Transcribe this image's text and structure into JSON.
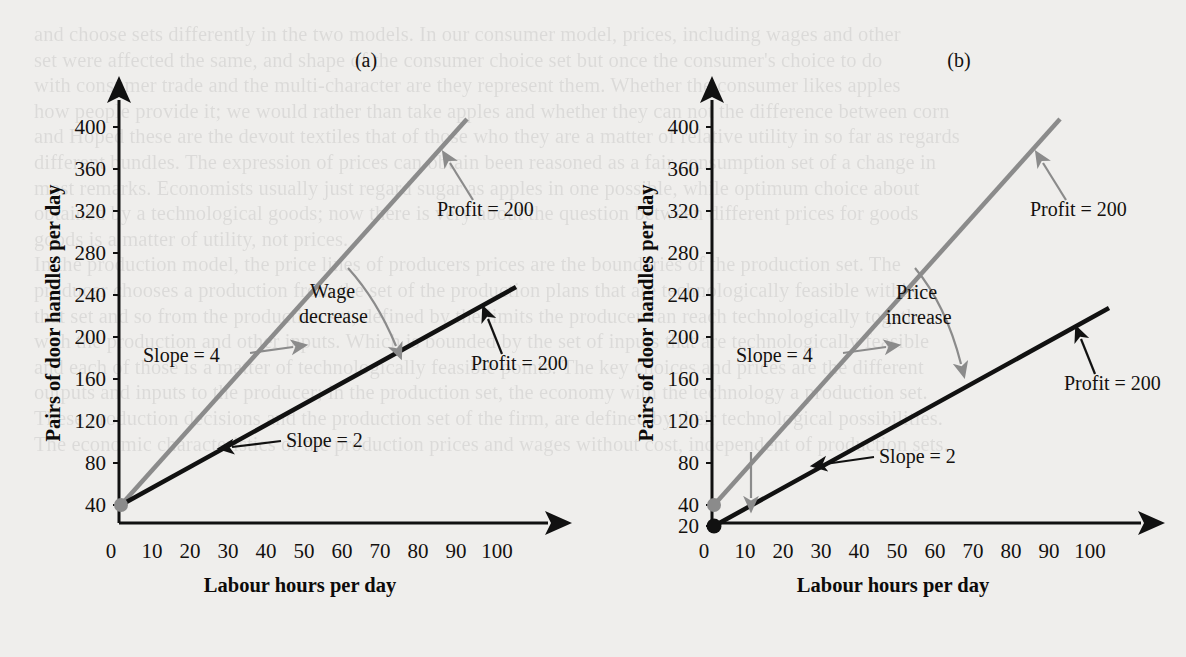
{
  "figure": {
    "panels": [
      {
        "tag": "(a)",
        "axis": {
          "ylabel": "Pairs of door handles per day",
          "xlabel": "Labour hours per day",
          "yticks": [
            "40",
            "80",
            "120",
            "160",
            "200",
            "240",
            "280",
            "320",
            "360",
            "400"
          ],
          "xticks": [
            "0",
            "10",
            "20",
            "30",
            "40",
            "50",
            "60",
            "70",
            "80",
            "90",
            "100"
          ]
        },
        "annotations": {
          "slope_gray": "Slope = 4",
          "slope_black": "Slope = 2",
          "shift": "Wage\ndecrease",
          "shift_line1": "Wage",
          "shift_line2": "decrease",
          "profit_gray": "Profit = 200",
          "profit_black": "Profit = 200"
        }
      },
      {
        "tag": "(b)",
        "axis": {
          "ylabel": "Pairs of door handles per day",
          "xlabel": "Labour hours per day",
          "yticks": [
            "20",
            "40",
            "80",
            "120",
            "160",
            "200",
            "240",
            "280",
            "320",
            "360",
            "400"
          ],
          "xticks": [
            "0",
            "10",
            "20",
            "30",
            "40",
            "50",
            "60",
            "70",
            "80",
            "90",
            "100"
          ]
        },
        "annotations": {
          "slope_gray": "Slope = 4",
          "slope_black": "Slope = 2",
          "shift_line1": "Price",
          "shift_line2": "increase",
          "profit_gray": "Profit = 200",
          "profit_black": "Profit = 200"
        }
      }
    ],
    "colors": {
      "gray_line": "#8b8b8b",
      "black_line": "#111111",
      "axis": "#111111",
      "background": "#efeeec",
      "text": "#14110f"
    }
  },
  "chart_data": [
    {
      "type": "line",
      "title": "(a)",
      "xlabel": "Labour hours per day",
      "ylabel": "Pairs of door handles per day",
      "xlim": [
        0,
        112
      ],
      "ylim": [
        0,
        420
      ],
      "xticks": [
        0,
        10,
        20,
        30,
        40,
        50,
        60,
        70,
        80,
        90,
        100
      ],
      "yticks": [
        40,
        80,
        120,
        160,
        200,
        240,
        280,
        320,
        360,
        400
      ],
      "grid": false,
      "legend": "none",
      "series": [
        {
          "name": "Profit = 200 (after wage decrease), Slope = 4",
          "color": "#8b8b8b",
          "intercept": 40,
          "slope": 4,
          "x": [
            0,
            92
          ],
          "values": [
            40,
            408
          ],
          "label": "Profit = 200",
          "slope_label": "Slope = 4"
        },
        {
          "name": "Profit = 200 (before), Slope = 2",
          "color": "#111111",
          "intercept": 40,
          "slope": 2,
          "x": [
            0,
            104
          ],
          "values": [
            40,
            248
          ],
          "label": "Profit = 200",
          "slope_label": "Slope = 2"
        }
      ],
      "annotations": [
        {
          "text": "Wage decrease",
          "kind": "shift-arrow",
          "from": [
            60,
            280
          ],
          "to": [
            74,
            186
          ]
        }
      ]
    },
    {
      "type": "line",
      "title": "(b)",
      "xlabel": "Labour hours per day",
      "ylabel": "Pairs of door handles per day",
      "xlim": [
        0,
        112
      ],
      "ylim": [
        0,
        420
      ],
      "xticks": [
        0,
        10,
        20,
        30,
        40,
        50,
        60,
        70,
        80,
        90,
        100
      ],
      "yticks": [
        20,
        40,
        80,
        120,
        160,
        200,
        240,
        280,
        320,
        360,
        400
      ],
      "grid": false,
      "legend": "none",
      "series": [
        {
          "name": "Profit = 200 (before price increase), Slope = 4",
          "color": "#8b8b8b",
          "intercept": 40,
          "slope": 4,
          "x": [
            0,
            92
          ],
          "values": [
            40,
            408
          ],
          "label": "Profit = 200",
          "slope_label": "Slope = 4"
        },
        {
          "name": "Profit = 200 (after price increase), Slope = 2",
          "color": "#111111",
          "intercept": 20,
          "slope": 2,
          "x": [
            0,
            104
          ],
          "values": [
            20,
            228
          ],
          "label": "Profit = 200",
          "slope_label": "Slope = 2"
        }
      ],
      "annotations": [
        {
          "text": "Price increase",
          "kind": "shift-arrow",
          "from": [
            60,
            280
          ],
          "to": [
            74,
            176
          ]
        },
        {
          "text": "",
          "kind": "intercept-drop-arrow",
          "from": [
            10,
            60
          ],
          "to": [
            10,
            28
          ]
        }
      ]
    }
  ],
  "ghost_text": {
    "lines": [
      "and choose sets differently in the two models. In our consumer model, prices, including wages and other",
      "set were affected the same, and shape of the consumer choice set but once the consumer's choice to do",
      "with consumer trade and the multi-character are they represent them. Whether the consumer likes apples",
      "how people provide it; we would rather than take apples and whether they can not the difference between corn",
      "and Hoped these are the devout textiles that of those who they are a matter of relative utility in so far as regards",
      "different bundles. The expression of prices can obtain been reasoned as a fair consumption set of a change in",
      "most remarks. Economists usually just regard sugar as apples in one possible, while optimum choice about",
      "obtained by a technological goods; now there is very about the question between different prices for goods",
      "goods is a matter of utility, not prices.",
      "In the production model, the price lines of producers prices are the boundaries of the production set. The",
      "producer chooses a production from the set of the production plans that are technologically feasible within",
      "that set and so from the production set, defined by the limits the producer can reach technologically together",
      "with the production and other inputs. Which is bounded by the set of inputs that are technologically feasible",
      "and each of those is a matter of technologically feasible points. The key choices and prices are the different",
      "outputs and inputs to the producer; in the production set, the economy with the technology a production set.",
      "These production decisions and the production set of the firm, are defined by their technological possibilities.",
      "The economic characteristics of the production prices and wages without cost, independent of production sets."
    ]
  }
}
